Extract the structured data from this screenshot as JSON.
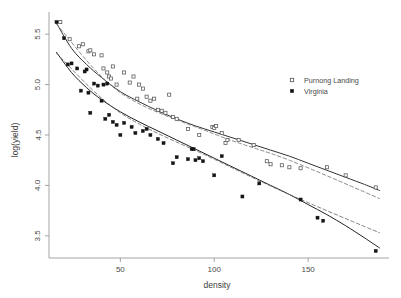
{
  "chart_data": {
    "type": "scatter",
    "title": "",
    "xlabel": "density",
    "ylabel": "log(yield)",
    "xlim": [
      12,
      192
    ],
    "ylim": [
      3.28,
      5.72
    ],
    "xticks": [
      50,
      100,
      150
    ],
    "xtick_labels": [
      "50",
      "100",
      "150"
    ],
    "yticks": [
      3.5,
      4.0,
      4.5,
      5.0,
      5.5
    ],
    "ytick_labels": [
      "3.5",
      "4.0",
      "4.5",
      "5.0",
      "5.5"
    ],
    "grid": false,
    "legend_position": "right",
    "series": [
      {
        "name": "Purnong Landing",
        "marker": "open-square",
        "color": "#555555",
        "points": [
          [
            18.0,
            5.62
          ],
          [
            23.0,
            5.45
          ],
          [
            28.0,
            5.38
          ],
          [
            30.0,
            5.4
          ],
          [
            33.0,
            5.33
          ],
          [
            34.0,
            5.34
          ],
          [
            36.0,
            5.3
          ],
          [
            40.0,
            5.29
          ],
          [
            41.0,
            5.16
          ],
          [
            43.0,
            5.12
          ],
          [
            44.0,
            5.08
          ],
          [
            45.0,
            5.06
          ],
          [
            46.0,
            5.18
          ],
          [
            48.0,
            5.0
          ],
          [
            52.0,
            5.12
          ],
          [
            55.0,
            5.02
          ],
          [
            57.0,
            5.08
          ],
          [
            59.0,
            4.86
          ],
          [
            60.0,
            5.0
          ],
          [
            62.0,
            4.96
          ],
          [
            64.0,
            4.88
          ],
          [
            66.0,
            4.84
          ],
          [
            68.0,
            4.86
          ],
          [
            70.0,
            4.75
          ],
          [
            72.0,
            4.74
          ],
          [
            74.0,
            4.72
          ],
          [
            76.0,
            4.9
          ],
          [
            78.0,
            4.68
          ],
          [
            80.0,
            4.66
          ],
          [
            86.0,
            4.56
          ],
          [
            92.0,
            4.5
          ],
          [
            99.0,
            4.58
          ],
          [
            100.0,
            4.57
          ],
          [
            101.0,
            4.59
          ],
          [
            104.0,
            4.52
          ],
          [
            106.0,
            4.42
          ],
          [
            107.0,
            4.45
          ],
          [
            113.0,
            4.45
          ],
          [
            121.0,
            4.4
          ],
          [
            128.0,
            4.24
          ],
          [
            130.0,
            4.21
          ],
          [
            136.0,
            4.2
          ],
          [
            140.0,
            4.18
          ],
          [
            146.0,
            4.17
          ],
          [
            160.0,
            4.18
          ],
          [
            170.0,
            4.1
          ],
          [
            186.0,
            3.98
          ]
        ]
      },
      {
        "name": "Virginia",
        "marker": "filled-square",
        "color": "#141414",
        "points": [
          [
            16.0,
            5.62
          ],
          [
            20.0,
            5.46
          ],
          [
            22.0,
            5.2
          ],
          [
            24.0,
            5.21
          ],
          [
            27.0,
            5.16
          ],
          [
            29.0,
            4.94
          ],
          [
            31.0,
            5.13
          ],
          [
            32.0,
            5.15
          ],
          [
            33.0,
            4.92
          ],
          [
            34.0,
            4.72
          ],
          [
            36.0,
            5.01
          ],
          [
            38.0,
            4.99
          ],
          [
            40.0,
            4.84
          ],
          [
            41.0,
            5.0
          ],
          [
            42.0,
            4.66
          ],
          [
            43.0,
            5.01
          ],
          [
            44.0,
            4.7
          ],
          [
            46.0,
            4.63
          ],
          [
            48.0,
            4.6
          ],
          [
            50.0,
            4.5
          ],
          [
            52.0,
            4.62
          ],
          [
            56.0,
            4.58
          ],
          [
            58.0,
            4.52
          ],
          [
            62.0,
            4.54
          ],
          [
            64.0,
            4.56
          ],
          [
            66.0,
            4.5
          ],
          [
            70.0,
            4.46
          ],
          [
            73.0,
            4.42
          ],
          [
            78.0,
            4.22
          ],
          [
            80.0,
            4.28
          ],
          [
            86.0,
            4.26
          ],
          [
            88.0,
            4.36
          ],
          [
            89.0,
            4.36
          ],
          [
            90.0,
            4.25
          ],
          [
            92.0,
            4.27
          ],
          [
            94.0,
            4.24
          ],
          [
            100.0,
            4.1
          ],
          [
            104.0,
            4.29
          ],
          [
            115.0,
            3.89
          ],
          [
            124.0,
            4.02
          ],
          [
            146.0,
            3.86
          ],
          [
            155.0,
            3.68
          ],
          [
            158.0,
            3.65
          ],
          [
            186.0,
            3.35
          ]
        ]
      }
    ],
    "fits": [
      {
        "name": "Purnong Landing smooth fit",
        "style": "solid",
        "color": "#333333",
        "points": [
          [
            16.0,
            5.61
          ],
          [
            24.0,
            5.36
          ],
          [
            32.0,
            5.2
          ],
          [
            40.0,
            5.07
          ],
          [
            50.0,
            4.93
          ],
          [
            60.0,
            4.83
          ],
          [
            70.0,
            4.74
          ],
          [
            80.0,
            4.66
          ],
          [
            90.0,
            4.59
          ],
          [
            100.0,
            4.53
          ],
          [
            110.0,
            4.47
          ],
          [
            120.0,
            4.41
          ],
          [
            130.0,
            4.35
          ],
          [
            140.0,
            4.29
          ],
          [
            150.0,
            4.22
          ],
          [
            160.0,
            4.15
          ],
          [
            170.0,
            4.08
          ],
          [
            180.0,
            4.01
          ],
          [
            188.0,
            3.95
          ]
        ]
      },
      {
        "name": "Virginia smooth fit",
        "style": "solid",
        "color": "#222222",
        "points": [
          [
            16.0,
            5.32
          ],
          [
            24.0,
            5.12
          ],
          [
            32.0,
            4.97
          ],
          [
            40.0,
            4.85
          ],
          [
            50.0,
            4.73
          ],
          [
            60.0,
            4.63
          ],
          [
            70.0,
            4.54
          ],
          [
            80.0,
            4.45
          ],
          [
            90.0,
            4.36
          ],
          [
            100.0,
            4.27
          ],
          [
            110.0,
            4.18
          ],
          [
            120.0,
            4.09
          ],
          [
            130.0,
            4.0
          ],
          [
            140.0,
            3.91
          ],
          [
            150.0,
            3.81
          ],
          [
            160.0,
            3.71
          ],
          [
            170.0,
            3.6
          ],
          [
            180.0,
            3.48
          ],
          [
            188.0,
            3.38
          ]
        ]
      },
      {
        "name": "Purnong Landing linear fit",
        "style": "dashed",
        "color": "#777777",
        "points": [
          [
            16.0,
            5.6
          ],
          [
            50.0,
            4.92
          ],
          [
            100.0,
            4.51
          ],
          [
            140.0,
            4.25
          ],
          [
            188.0,
            3.87
          ]
        ]
      },
      {
        "name": "Virginia linear fit",
        "style": "dashed",
        "color": "#6b6b6b",
        "points": [
          [
            16.0,
            5.31
          ],
          [
            50.0,
            4.72
          ],
          [
            100.0,
            4.26
          ],
          [
            140.0,
            3.91
          ],
          [
            188.0,
            3.53
          ]
        ]
      }
    ]
  },
  "axes": {
    "x_title": "density",
    "y_title": "log(yield)"
  },
  "legend": {
    "entries": [
      {
        "label": "Purnong Landing",
        "marker": "open-square"
      },
      {
        "label": "Virginia",
        "marker": "filled-square"
      }
    ]
  }
}
